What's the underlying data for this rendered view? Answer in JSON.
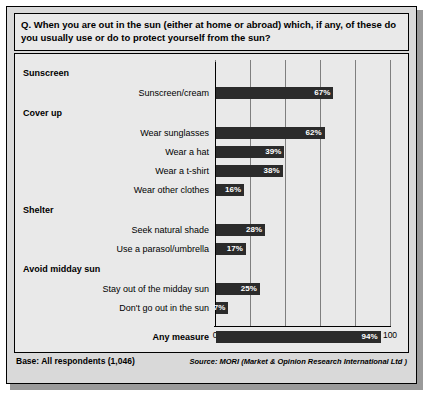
{
  "question": "Q. When you are out in the sun (either at home or abroad) which, if any, of these do you usually use or do to protect yourself from the sun?",
  "base": "Base: All respondents (1,046)",
  "source": "Source: MORI (Market & Opinion Research International Ltd )",
  "colors": {
    "bar": "#2b2b2b",
    "panel": "#e9e9e9",
    "frame": "#d9d9d9",
    "grid": "#7f7f7f"
  },
  "chart_data": {
    "type": "bar",
    "title": "",
    "xlabel": "",
    "ylabel": "",
    "xlim": [
      0,
      100
    ],
    "xticks": [
      "0",
      "20",
      "40",
      "60",
      "80",
      "100"
    ],
    "grid": true,
    "orientation": "horizontal",
    "groups": [
      {
        "group": "Sunscreen",
        "items": [
          {
            "label": "Sunscreen/cream",
            "value": 67,
            "value_label": "67%"
          }
        ]
      },
      {
        "group": "Cover up",
        "items": [
          {
            "label": "Wear sunglasses",
            "value": 62,
            "value_label": "62%"
          },
          {
            "label": "Wear a hat",
            "value": 39,
            "value_label": "39%"
          },
          {
            "label": "Wear a t-shirt",
            "value": 38,
            "value_label": "38%"
          },
          {
            "label": "Wear other clothes",
            "value": 16,
            "value_label": "16%"
          }
        ]
      },
      {
        "group": "Shelter",
        "items": [
          {
            "label": "Seek natural shade",
            "value": 28,
            "value_label": "28%"
          },
          {
            "label": "Use a parasol/umbrella",
            "value": 17,
            "value_label": "17%"
          }
        ]
      },
      {
        "group": "Avoid midday sun",
        "items": [
          {
            "label": "Stay out of the midday sun",
            "value": 25,
            "value_label": "25%"
          },
          {
            "label": "Don't go out in the sun",
            "value": 7,
            "value_label": "7%"
          }
        ]
      },
      {
        "group": "",
        "items": [
          {
            "label": "Any measure",
            "value": 94,
            "value_label": "94%",
            "bold": true
          }
        ]
      }
    ]
  }
}
